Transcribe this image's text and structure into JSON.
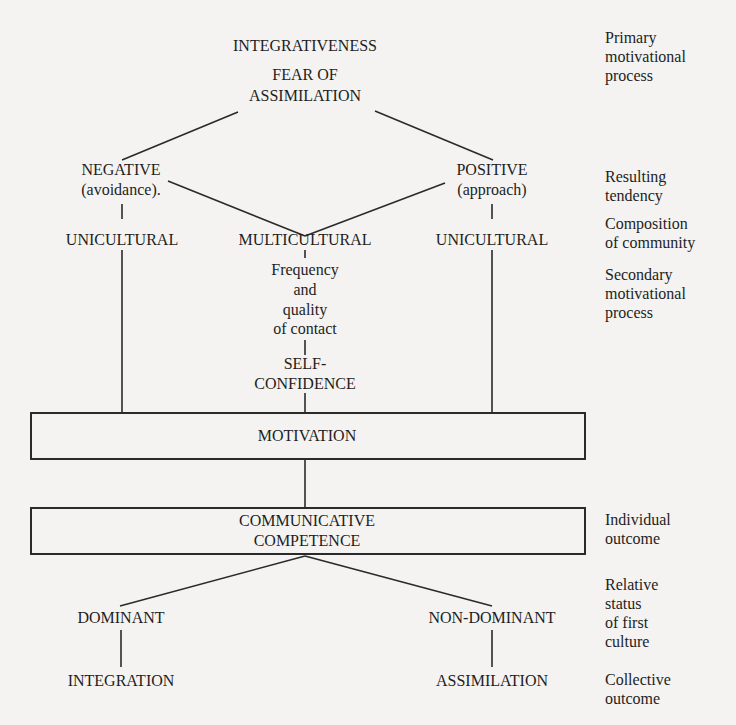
{
  "diagram": {
    "top": {
      "integrativeness": "INTEGRATIVENESS",
      "fear_line1": "FEAR OF",
      "fear_line2": "ASSIMILATION"
    },
    "tendency": {
      "negative": "NEGATIVE",
      "negative_sub": "(avoidance).",
      "positive": "POSITIVE",
      "positive_sub": "(approach)"
    },
    "community": {
      "left": "UNICULTURAL",
      "middle": "MULTICULTURAL",
      "right": "UNICULTURAL"
    },
    "contact": {
      "line1": "Frequency",
      "line2": "and",
      "line3": "quality",
      "line4": "of contact"
    },
    "self_confidence": {
      "line1": "SELF-",
      "line2": "CONFIDENCE"
    },
    "motivation": "MOTIVATION",
    "competence": {
      "line1": "COMMUNICATIVE",
      "line2": "COMPETENCE"
    },
    "status": {
      "dominant": "DOMINANT",
      "non_dominant": "NON-DOMINANT"
    },
    "outcome": {
      "integration": "INTEGRATION",
      "assimilation": "ASSIMILATION"
    }
  },
  "side_labels": {
    "primary": [
      "Primary",
      "motivational",
      "process"
    ],
    "resulting": [
      "Resulting",
      "tendency"
    ],
    "composition": [
      "Composition",
      "of community"
    ],
    "secondary": [
      "Secondary",
      "motivational",
      "process"
    ],
    "individual": [
      "Individual",
      "outcome"
    ],
    "relative": [
      "Relative",
      "status",
      "of first",
      "culture"
    ],
    "collective": [
      "Collective",
      "outcome"
    ]
  }
}
